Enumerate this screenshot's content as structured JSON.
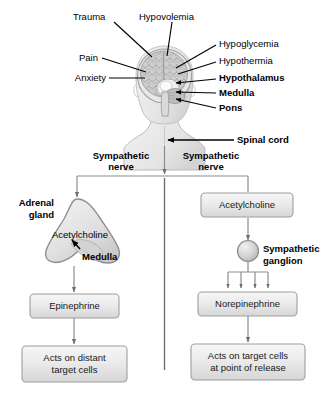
{
  "figure": {
    "colors": {
      "stroke": "#000000",
      "box_fill_top": "#f4f4f4",
      "box_fill_bottom": "#dcdcdc",
      "box_border": "#9a9a9a",
      "organ_fill": "#e2e2e2",
      "organ_border": "#8a8a8a",
      "connector": "#808080",
      "head_fill": "#ececec",
      "brain_fill": "#c9c9c9",
      "divider": "#6e6e6e"
    }
  },
  "stimuli": [
    {
      "id": "trauma",
      "label": "Trauma",
      "bold": false
    },
    {
      "id": "hypovolemia",
      "label": "Hypovolemia",
      "bold": false
    },
    {
      "id": "pain",
      "label": "Pain",
      "bold": false
    },
    {
      "id": "anxiety",
      "label": "Anxiety",
      "bold": false
    },
    {
      "id": "hypoglycemia",
      "label": "Hypoglycemia",
      "bold": false
    },
    {
      "id": "hypothermia",
      "label": "Hypothermia",
      "bold": false
    }
  ],
  "brain_structures": [
    {
      "id": "hypothalamus",
      "label": "Hypothalamus",
      "bold": true
    },
    {
      "id": "medulla",
      "label": "Medulla",
      "bold": true
    },
    {
      "id": "pons",
      "label": "Pons",
      "bold": true
    }
  ],
  "spinal_cord": {
    "label": "Spinal cord",
    "bold": true
  },
  "nerves": {
    "left": {
      "line1": "Sympathetic",
      "line2": "nerve"
    },
    "right": {
      "line1": "Sympathetic",
      "line2": "nerve"
    }
  },
  "left_pathway": {
    "organ_label": {
      "line1": "Adrenal",
      "line2": "gland"
    },
    "neurotransmitter": "Acetylcholine",
    "organ_region": "Medulla",
    "hormone_box": "Epinephrine",
    "outcome_box": {
      "line1": "Acts on distant",
      "line2": "target cells"
    }
  },
  "right_pathway": {
    "neurotransmitter_box": "Acetylcholine",
    "ganglion_label": {
      "line1": "Sympathetic",
      "line2": "ganglion"
    },
    "neurotransmitter_box2": "Norepinephrine",
    "outcome_box": {
      "line1": "Acts on target cells",
      "line2": "at point of release"
    },
    "terminal_arrow_count": 4
  }
}
